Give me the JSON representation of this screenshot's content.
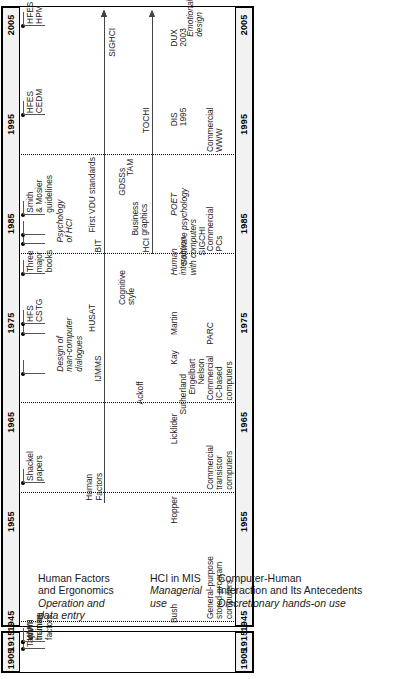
{
  "figure": {
    "type": "timeline",
    "orientation": "vertical-rotated",
    "axis_title": "",
    "year_ticks_main": [
      "1945",
      "1955",
      "1965",
      "1975",
      "1985",
      "1995",
      "2005"
    ],
    "year_ticks_early": [
      "1905",
      "1915"
    ],
    "axis_break": true,
    "lanes": [
      {
        "id": "hfe",
        "title": "Human Factors\nand Ergonomics",
        "subtitle": "Operation and\ndata entry"
      },
      {
        "id": "mis",
        "title": "HCI in MIS",
        "subtitle": "Managerial\nuse"
      },
      {
        "id": "chi",
        "title": "Computer-Human\nInteraction and Its Antecedents",
        "subtitle": "Discretionary hands-on use"
      }
    ],
    "era_dividers": [
      {
        "year": 1945,
        "label": ""
      },
      {
        "year": 1958,
        "label": ""
      },
      {
        "year": 1967,
        "label": ""
      },
      {
        "year": 1982,
        "label": ""
      },
      {
        "year": 1992,
        "label": ""
      }
    ],
    "events": [
      {
        "lane": "hfe",
        "year": 1911,
        "label": "Taylor",
        "italic": false
      },
      {
        "lane": "hfe",
        "year": 1915,
        "label": "WWI\ntraining",
        "italic": false
      },
      {
        "lane": "hfe",
        "year": 1943,
        "label": "WWII\nhuman\nfactors",
        "italic": false
      },
      {
        "lane": "hfe",
        "year": 1959,
        "label": "Shackel\npapers",
        "italic": false
      },
      {
        "lane": "hfe",
        "year": 1970,
        "label": "Design of\nman-computer\ndialogues",
        "italic": true
      },
      {
        "lane": "hfe",
        "year": 1974,
        "label": "HUSAT",
        "italic": false
      },
      {
        "lane": "hfe",
        "year": 1975,
        "label": "HFS\nCSTG",
        "italic": false
      },
      {
        "lane": "hfe",
        "year": 1980,
        "label": "Three\nmajor\nbooks",
        "italic": false
      },
      {
        "lane": "hfe",
        "year": 1983,
        "label": "Psychology\nof HCI",
        "italic": true
      },
      {
        "lane": "hfe",
        "year": 1986,
        "label": "Smith\n& Mosier\nguidelines",
        "italic": false
      },
      {
        "lane": "hfe",
        "year": 1984,
        "label": "First VDU standards",
        "italic": false
      },
      {
        "lane": "hfe",
        "year": 1996,
        "label": "HFES\nCEDM",
        "italic": false
      },
      {
        "lane": "hfe",
        "year": 2005,
        "label": "HFES\nHPM",
        "italic": false
      },
      {
        "lane": "mis",
        "year": 1967,
        "label": "Ackoff",
        "italic": false
      },
      {
        "lane": "mis",
        "year": 1977,
        "label": "Cognitive\nstyle",
        "italic": false
      },
      {
        "lane": "mis",
        "year": 1984,
        "label": "Business\ngraphics",
        "italic": false
      },
      {
        "lane": "mis",
        "year": 1988,
        "label": "GDSSs",
        "italic": false
      },
      {
        "lane": "mis",
        "year": 1990,
        "label": "TAM",
        "italic": false
      },
      {
        "lane": "mis",
        "year": 2002,
        "label": "SIGHCI",
        "italic": false
      },
      {
        "lane": "chi",
        "year": 1945,
        "label": "Bush",
        "italic": false
      },
      {
        "lane": "chi",
        "year": 1955,
        "label": "Hopper",
        "italic": false
      },
      {
        "lane": "chi",
        "year": 1963,
        "label": "Licklider",
        "italic": false
      },
      {
        "lane": "chi",
        "year": 1966,
        "label": "Sutherland",
        "italic": false
      },
      {
        "lane": "chi",
        "year": 1968,
        "label": "Engelbart",
        "italic": false
      },
      {
        "lane": "chi",
        "year": 1969,
        "label": "Nelson",
        "italic": false
      },
      {
        "lane": "chi",
        "year": 1971,
        "label": "Kay",
        "italic": false
      },
      {
        "lane": "chi",
        "year": 1973,
        "label": "PARC",
        "italic": false
      },
      {
        "lane": "chi",
        "year": 1974,
        "label": "Martin",
        "italic": false
      },
      {
        "lane": "chi",
        "year": 1980,
        "label": "Human\ninteraction\nwith computers",
        "italic": true
      },
      {
        "lane": "chi",
        "year": 1981,
        "label": "Software psychology",
        "italic": true
      },
      {
        "lane": "chi",
        "year": 1982,
        "label": "SIGCHI",
        "italic": false
      },
      {
        "lane": "chi",
        "year": 1986,
        "label": "POET",
        "italic": true
      },
      {
        "lane": "chi",
        "year": 1995,
        "label": "DIS\n1995",
        "italic": false
      },
      {
        "lane": "chi",
        "year": 2003,
        "label": "DUX\n2003",
        "italic": false
      },
      {
        "lane": "chi",
        "year": 2004,
        "label": "Emotional\ndesign",
        "italic": true
      }
    ],
    "ongoing_arrows": [
      {
        "lane": "mis",
        "label": "Human\nFactors",
        "start_year": 1957,
        "end_year": 2006
      },
      {
        "lane": "mis",
        "label": "IJMMS",
        "start_year": 1969,
        "end_year": 2006
      },
      {
        "lane": "mis",
        "label": "BIT",
        "start_year": 1982,
        "end_year": 2006
      },
      {
        "lane": "chi",
        "label": "HCI",
        "start_year": 1982,
        "end_year": 2006
      },
      {
        "lane": "chi",
        "label": "TOCHI",
        "start_year": 1994,
        "end_year": 2006
      }
    ],
    "platform_bands": [
      {
        "label": "General-purpose\nstored-program\ncomputers",
        "start_year": 1945,
        "end_year": 1958
      },
      {
        "label": "Commercial\ntransistor\ncomputers",
        "start_year": 1958,
        "end_year": 1967
      },
      {
        "label": "Commercial\nIC-based\ncomputers",
        "start_year": 1967,
        "end_year": 1982
      },
      {
        "label": "Commercial\nPCs",
        "start_year": 1982,
        "end_year": 1992
      },
      {
        "label": "Commercial\nWWW",
        "start_year": 1992,
        "end_year": 2006
      }
    ],
    "colors": {
      "line": "#000000",
      "connector": "#555555",
      "arrow": "#444444",
      "axis_fill": "#f2f2f2",
      "text": "#1a1a1a"
    }
  }
}
